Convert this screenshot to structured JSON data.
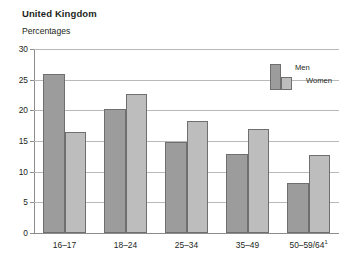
{
  "chart_data": {
    "type": "bar",
    "title": "United Kingdom",
    "subtitle": "Percentages",
    "xlabel": "",
    "ylabel": "",
    "ylim": [
      0,
      30
    ],
    "yticks": [
      0,
      5,
      10,
      15,
      20,
      25,
      30
    ],
    "ytick_labels": [
      "0",
      "5",
      "10",
      "15",
      "20",
      "25",
      "30"
    ],
    "grid": true,
    "legend_position": "top-right",
    "categories": [
      "16–17",
      "18–24",
      "25–34",
      "35–49",
      "50–59/64"
    ],
    "category_footnotes": [
      "",
      "",
      "",
      "",
      "1"
    ],
    "series": [
      {
        "name": "Men",
        "color": "#9c9c9c",
        "values": [
          26.0,
          20.3,
          14.8,
          12.9,
          8.2
        ]
      },
      {
        "name": "Women",
        "color": "#bdbdbd",
        "values": [
          16.5,
          22.7,
          18.3,
          17.0,
          12.8
        ]
      }
    ]
  },
  "colors": {
    "men": "#9c9c9c",
    "women": "#bdbdbd",
    "bar_border": "#6f6f6f",
    "gridline": "#b9b9b9",
    "axis": "#8c8c8c",
    "text": "#231f20",
    "background": "#ffffff"
  }
}
